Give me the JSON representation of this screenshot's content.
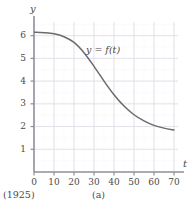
{
  "figure": {
    "caption": "(a)",
    "origin_note": "(1925)",
    "curve_label": "y = f(t)",
    "axis_label_y": "y",
    "axis_label_x": "t"
  },
  "style": {
    "curve_color": "#6b6b6b",
    "axis_color": "#8f8f99",
    "grid_major_color": "#dcdce4",
    "grid_minor_color": "#ececf2",
    "text_color": "#3a3a3a",
    "background": "#ffffff"
  },
  "chart_data": {
    "type": "line",
    "title": "",
    "subtitle": "",
    "xlabel": "t",
    "ylabel": "y",
    "xlim": [
      0,
      72
    ],
    "ylim": [
      0,
      6.6
    ],
    "xticks": [
      0,
      10,
      20,
      30,
      40,
      50,
      60,
      70
    ],
    "xticklabels": [
      "0",
      "10",
      "20",
      "30",
      "40",
      "50",
      "60",
      "70"
    ],
    "yticks": [
      1,
      2,
      3,
      4,
      5,
      6
    ],
    "yticklabels": [
      "1",
      "2",
      "3",
      "4",
      "5",
      "6"
    ],
    "grid": true,
    "grid_minor_step_x": 5,
    "grid_minor_step_y": 0.5,
    "legend": "none",
    "annotations": [
      {
        "text": "y = f(t)",
        "x": 34,
        "y": 5.05
      },
      {
        "text": "(1925)",
        "x": 0,
        "y": -1.05
      },
      {
        "text": "(a)",
        "x": 35,
        "y": -1.05
      }
    ],
    "series": [
      {
        "name": "f(t)",
        "x": [
          0,
          5,
          10,
          15,
          20,
          25,
          30,
          35,
          40,
          45,
          50,
          55,
          60,
          65,
          70
        ],
        "values": [
          6.15,
          6.13,
          6.08,
          5.95,
          5.7,
          5.25,
          4.65,
          4.0,
          3.4,
          2.9,
          2.52,
          2.25,
          2.05,
          1.93,
          1.85
        ]
      }
    ]
  }
}
